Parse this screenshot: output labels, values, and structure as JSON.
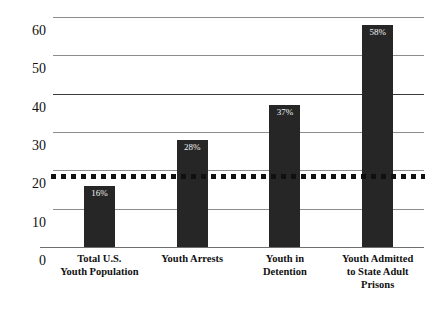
{
  "chart_data": {
    "type": "bar",
    "title": "",
    "xlabel": "",
    "ylabel": "PROPORTION (%)",
    "ylim": [
      0,
      60
    ],
    "grid": true,
    "legend": "none",
    "categories": [
      "Total U.S.\nYouth Population",
      "Youth Arrests",
      "Youth in\nDetention",
      "Youth Admitted\nto State Adult\nPrisons"
    ],
    "values": [
      16,
      28,
      37,
      58
    ],
    "data_labels": [
      "16%",
      "28%",
      "37%",
      "58%"
    ],
    "yticks": [
      0,
      10,
      20,
      30,
      40,
      50,
      60
    ],
    "ytick_labels": [
      "0",
      "10",
      "20",
      "30",
      "40",
      "50",
      "60"
    ],
    "annotations": [
      {
        "name": "reference-line",
        "type": "horizontal-dotted-line",
        "value": 18.5,
        "style": "dotted",
        "color": "#101010"
      }
    ],
    "colors": {
      "bar": "#262626",
      "gridline": "#8d8d8d",
      "baseline": "#6f6f6f",
      "data_label_text": "#f2f2f2",
      "axis_text": "#111111"
    }
  },
  "categories_lines": [
    [
      "Total U.S.",
      "Youth Population"
    ],
    [
      "Youth Arrests"
    ],
    [
      "Youth in",
      "Detention"
    ],
    [
      "Youth Admitted",
      "to State Adult",
      "Prisons"
    ]
  ]
}
